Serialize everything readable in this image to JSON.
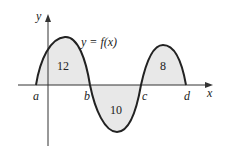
{
  "diagram": {
    "function_label": "y = f(x)",
    "axis_x_label": "x",
    "axis_y_label": "y",
    "points": [
      "a",
      "b",
      "c",
      "d"
    ],
    "regions": [
      {
        "between": "a-b",
        "area": "12",
        "sign": "positive"
      },
      {
        "between": "b-c",
        "area": "10",
        "sign": "negative"
      },
      {
        "between": "c-d",
        "area": "8",
        "sign": "positive"
      }
    ],
    "colors": {
      "curve": "#222222",
      "fill": "#e8e8e8",
      "axis": "#333333"
    }
  }
}
